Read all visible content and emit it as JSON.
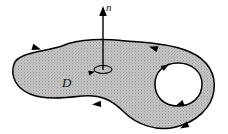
{
  "figure": {
    "kind": "oriented-surface-with-hole",
    "caption_labels": {
      "normal_vector": "n",
      "region": "D"
    },
    "colors": {
      "background": "#ffffff",
      "region_fill": "#b8b8b8",
      "outline": "#000000",
      "label": "#111111"
    },
    "normal_vector": {
      "label": "n",
      "base": [
        103,
        68
      ],
      "tip": [
        103,
        10
      ],
      "arrowhead": "up"
    },
    "curl_indicator": {
      "name": "orientation-ellipse",
      "center": [
        103,
        69
      ],
      "rx": 9,
      "ry": 4,
      "arrow_direction": "counterclockwise"
    },
    "outer_boundary": {
      "orientation": "counterclockwise",
      "arrows": [
        {
          "at": [
            40,
            50
          ],
          "direction": "left",
          "angle": -150
        },
        {
          "at": [
            148,
            48
          ],
          "direction": "left",
          "angle": 195
        },
        {
          "at": [
            88,
            104
          ],
          "direction": "right",
          "angle": 2
        },
        {
          "at": [
            176,
            127
          ],
          "direction": "right",
          "angle": 25
        }
      ]
    },
    "inner_boundary": {
      "orientation": "clockwise",
      "hole_center": [
        178,
        85
      ],
      "arrows": [
        {
          "at": [
            168,
            65
          ],
          "direction": "left",
          "angle": 200
        },
        {
          "at": [
            176,
            105
          ],
          "direction": "right",
          "angle": 10
        }
      ]
    }
  }
}
